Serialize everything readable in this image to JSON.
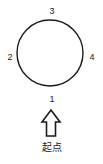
{
  "diagram": {
    "type": "circular-route-diagram",
    "background_color": "#ffffff",
    "stroke_color": "#1a1a1a",
    "circle": {
      "name": "route-loop",
      "center_x": 50,
      "center_y": 53,
      "radius": 33,
      "stroke_width": 1.4
    },
    "labels": [
      {
        "id": "top",
        "text": "3",
        "position": "top"
      },
      {
        "id": "left",
        "text": "2",
        "position": "left"
      },
      {
        "id": "right",
        "text": "4",
        "position": "right"
      },
      {
        "id": "bottom",
        "text": "1",
        "position": "bottom"
      }
    ],
    "arrow": {
      "name": "start-direction-arrow",
      "direction": "up",
      "style": "hollow-outline",
      "fill": "#ffffff",
      "stroke": "#1a1a1a"
    },
    "caption": "起点"
  }
}
